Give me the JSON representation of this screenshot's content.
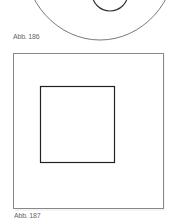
{
  "figures": [
    {
      "label": "Abb. 186",
      "shape": "circle-with-inner-circle"
    },
    {
      "label": "Abb. 187",
      "shape": "square-with-inner-square"
    }
  ],
  "colors": {
    "stroke": "#333333",
    "outer_stroke": "#777777",
    "caption": "#666666"
  }
}
